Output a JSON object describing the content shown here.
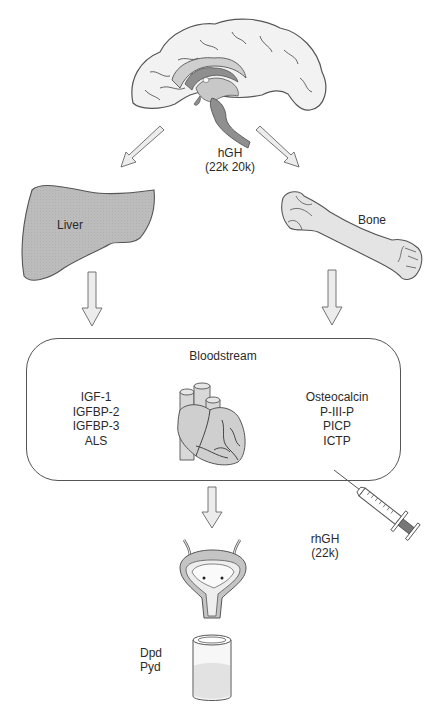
{
  "diagram": {
    "title": "",
    "nodes": {
      "brain": {
        "icon": "brain-icon"
      },
      "hgh": {
        "line1": "hGH",
        "line2": "(22k 20k)"
      },
      "liver": {
        "label": "Liver",
        "icon": "liver-icon"
      },
      "bone": {
        "label": "Bone",
        "icon": "bone-icon"
      },
      "bloodstream": {
        "label": "Bloodstream",
        "icon": "heart-icon",
        "left_markers": [
          "IGF-1",
          "IGFBP-2",
          "IGFBP-3",
          "ALS"
        ],
        "right_markers": [
          "Osteocalcin",
          "P-III-P",
          "PICP",
          "ICTP"
        ]
      },
      "rhgh": {
        "line1": "rhGH",
        "line2": "(22k)",
        "icon": "syringe-icon"
      },
      "bladder": {
        "icon": "bladder-icon"
      },
      "urine": {
        "line1": "Dpd",
        "line2": "Pyd",
        "icon": "urine-container-icon"
      }
    },
    "edges": [
      {
        "from": "brain",
        "to": "liver"
      },
      {
        "from": "brain",
        "to": "bone"
      },
      {
        "from": "liver",
        "to": "bloodstream"
      },
      {
        "from": "bone",
        "to": "bloodstream"
      },
      {
        "from": "bloodstream",
        "to": "bladder"
      },
      {
        "from": "syringe",
        "to": "bloodstream"
      }
    ],
    "colors": {
      "organ_fill": "#bdbdbd",
      "light_fill": "#e6e6e6",
      "dark_fill": "#8f8f8f",
      "stroke": "#555555",
      "arrow_fill": "#e8e8e8"
    }
  }
}
